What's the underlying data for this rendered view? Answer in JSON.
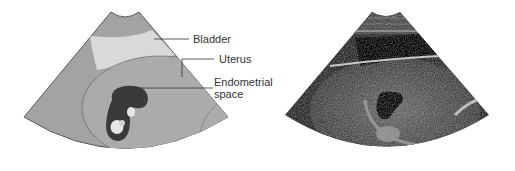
{
  "figure": {
    "left_panel": {
      "type": "schematic ultrasound illustration",
      "labels": [
        {
          "id": "bladder",
          "text": "Bladder"
        },
        {
          "id": "uterus",
          "text": "Uterus"
        },
        {
          "id": "endometrial_line1",
          "text": "Endometrial"
        },
        {
          "id": "endometrial_line2",
          "text": "space"
        }
      ],
      "colors": {
        "fan_fill": "#a3a3a3",
        "fan_edge": "#5a5a5a",
        "bladder_fill": "#d9d9d9",
        "uterus_fill": "#ababab",
        "endometrial_space_fill": "#3a3a3a",
        "fetal_part_fill": "#e6e6e6",
        "leader_line": "#333333"
      }
    },
    "right_panel": {
      "type": "ultrasound sonogram image",
      "colors": {
        "background": "#1a1a1a",
        "tissue": "#6e6e6e",
        "bladder": "#050505"
      }
    }
  }
}
